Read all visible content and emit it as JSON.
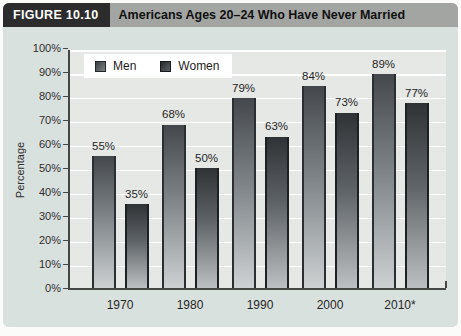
{
  "figure": {
    "label": "FIGURE 10.10",
    "title": "Americans Ages 20–24 Who Have Never Married"
  },
  "chart_data": {
    "type": "bar",
    "title": "Americans Ages 20–24 Who Have Never Married",
    "categories": [
      "1970",
      "1980",
      "1990",
      "2000",
      "2010*"
    ],
    "series": [
      {
        "name": "Men",
        "values": [
          55,
          68,
          79,
          84,
          89
        ]
      },
      {
        "name": "Women",
        "values": [
          35,
          50,
          63,
          73,
          77
        ]
      }
    ],
    "xlabel": "",
    "ylabel": "Percentage",
    "ylim": [
      0,
      100
    ],
    "y_ticks": [
      "0%",
      "10%",
      "20%",
      "30%",
      "40%",
      "50%",
      "60%",
      "70%",
      "80%",
      "90%",
      "100%"
    ],
    "value_labels": [
      [
        "55%",
        "68%",
        "79%",
        "84%",
        "89%"
      ],
      [
        "35%",
        "50%",
        "63%",
        "73%",
        "77%"
      ]
    ],
    "grid": true,
    "legend_position": "top-left"
  },
  "colors": {
    "header_label_bg": "#2b2c2b",
    "header_strip_bg": "#a3a5a3",
    "panel_bg": "#d9e1de",
    "plot_bg": "#e5e8e5",
    "gridline": "#ffffff",
    "axis": "#454745",
    "men_bar_top": "#44484c",
    "men_bar_bottom": "#cdd1d2",
    "women_bar_top": "#2f3336",
    "women_bar_bottom": "#bcc0c2"
  }
}
